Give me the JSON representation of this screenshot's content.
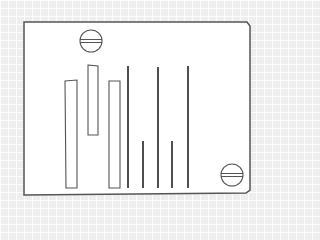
{
  "diagram": {
    "colors": {
      "background": "#eeeeee",
      "plate_fill": "#ffffff",
      "stroke": "#555555",
      "line_stroke": "#222222"
    },
    "plate": {
      "points": "24,22 247,22 250,26 250,190 246,193 24,195"
    },
    "screws": [
      {
        "name": "top-screw",
        "cx": 91,
        "cy": 41,
        "r": 11
      },
      {
        "name": "bottom-right-screw",
        "cx": 232,
        "cy": 175,
        "r": 11
      }
    ],
    "bars": [
      {
        "name": "bar-left",
        "points": "65,81 77,80 77,188 66,188"
      },
      {
        "name": "bar-middle",
        "points": "88,65 98,66 98,135 88,135"
      },
      {
        "name": "bar-right",
        "points": "109,81 120,81 120,188 109,188"
      }
    ],
    "lines": [
      {
        "name": "line-1",
        "x": 128,
        "y1": 66,
        "y2": 188
      },
      {
        "name": "line-2",
        "x": 143,
        "y1": 141,
        "y2": 188
      },
      {
        "name": "line-3",
        "x": 158,
        "y1": 67,
        "y2": 188
      },
      {
        "name": "line-4",
        "x": 172,
        "y1": 141,
        "y2": 188
      },
      {
        "name": "line-5",
        "x": 188,
        "y1": 66,
        "y2": 188
      }
    ]
  }
}
